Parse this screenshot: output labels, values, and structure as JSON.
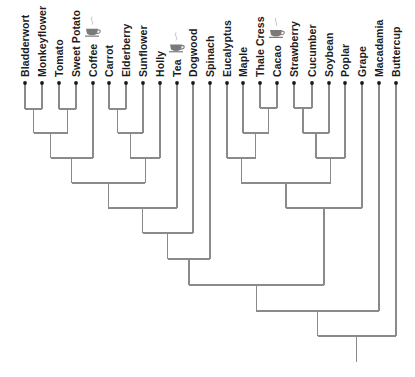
{
  "diagram": {
    "type": "dendrogram",
    "orientation": "root-bottom",
    "colors": {
      "edge": "#8a8a8a",
      "dot": "#1a1a1a",
      "label": "#1c1c1c",
      "icon": "#7a7a7a"
    },
    "leaf_y": 83,
    "label_baseline_y": 77,
    "leaves": [
      {
        "id": "bladderwort",
        "label": "Bladderwort",
        "x": 25
      },
      {
        "id": "monkeyflower",
        "label": "Monkeyflower",
        "x": 42
      },
      {
        "id": "tomato",
        "label": "Tomato",
        "x": 59
      },
      {
        "id": "sweet-potato",
        "label": "Sweet Potato",
        "x": 76
      },
      {
        "id": "coffee",
        "label": "Coffee",
        "x": 93,
        "icon": "tea-cup-icon"
      },
      {
        "id": "carrot",
        "label": "Carrot",
        "x": 109
      },
      {
        "id": "elderberry",
        "label": "Elderberry",
        "x": 126
      },
      {
        "id": "sunflower",
        "label": "Sunflower",
        "x": 143
      },
      {
        "id": "holly",
        "label": "Holly",
        "x": 160
      },
      {
        "id": "tea",
        "label": "Tea",
        "x": 177,
        "icon": "tea-cup-icon"
      },
      {
        "id": "dogwood",
        "label": "Dogwood",
        "x": 193
      },
      {
        "id": "spinach",
        "label": "Spinach",
        "x": 210
      },
      {
        "id": "eucalyptus",
        "label": "Eucalyptus",
        "x": 227
      },
      {
        "id": "maple",
        "label": "Maple",
        "x": 243
      },
      {
        "id": "thale-cress",
        "label": "Thale Cress",
        "x": 260
      },
      {
        "id": "cacao",
        "label": "Cacao",
        "x": 277,
        "icon": "tea-cup-icon"
      },
      {
        "id": "strawberry",
        "label": "Strawberry",
        "x": 294
      },
      {
        "id": "cucumber",
        "label": "Cucumber",
        "x": 312
      },
      {
        "id": "soybean",
        "label": "Soybean",
        "x": 329
      },
      {
        "id": "poplar",
        "label": "Poplar",
        "x": 345
      },
      {
        "id": "grape",
        "label": "Grape",
        "x": 362
      },
      {
        "id": "macadamia",
        "label": "Macadamia",
        "x": 379
      },
      {
        "id": "buttercup",
        "label": "Buttercup",
        "x": 396
      }
    ],
    "merges": [
      {
        "id": "n1",
        "left": "bladderwort",
        "right": "monkeyflower",
        "y": 109
      },
      {
        "id": "n2",
        "left": "tomato",
        "right": "sweet-potato",
        "y": 109
      },
      {
        "id": "n3",
        "left": "n1",
        "right": "n2",
        "y": 133
      },
      {
        "id": "n4",
        "left": "n3",
        "right": "coffee",
        "y": 158
      },
      {
        "id": "n5",
        "left": "carrot",
        "right": "elderberry",
        "y": 109
      },
      {
        "id": "n6",
        "left": "n5",
        "right": "sunflower",
        "y": 133
      },
      {
        "id": "n7",
        "left": "n6",
        "right": "holly",
        "y": 158
      },
      {
        "id": "n8",
        "left": "n4",
        "right": "n7",
        "y": 183
      },
      {
        "id": "n9",
        "left": "n8",
        "right": "tea",
        "y": 208
      },
      {
        "id": "n10",
        "left": "n9",
        "right": "dogwood",
        "y": 233
      },
      {
        "id": "n11",
        "left": "n10",
        "right": "spinach",
        "y": 259
      },
      {
        "id": "n12",
        "left": "thale-cress",
        "right": "cacao",
        "y": 108
      },
      {
        "id": "n13",
        "left": "maple",
        "right": "n12",
        "y": 133
      },
      {
        "id": "n14",
        "left": "eucalyptus",
        "right": "n13",
        "y": 158
      },
      {
        "id": "n15",
        "left": "strawberry",
        "right": "cucumber",
        "y": 108
      },
      {
        "id": "n16",
        "left": "n15",
        "right": "soybean",
        "y": 133
      },
      {
        "id": "n17",
        "left": "n16",
        "right": "poplar",
        "y": 158
      },
      {
        "id": "n18",
        "left": "n14",
        "right": "n17",
        "y": 183
      },
      {
        "id": "n19",
        "left": "n18",
        "right": "grape",
        "y": 208
      },
      {
        "id": "n20",
        "left": "n11",
        "right": "n19",
        "y": 285
      },
      {
        "id": "n21",
        "left": "n20",
        "right": "macadamia",
        "y": 311
      },
      {
        "id": "n22",
        "left": "n21",
        "right": "buttercup",
        "y": 336
      }
    ],
    "root": {
      "node": "n22",
      "stem_end_y": 362
    }
  }
}
